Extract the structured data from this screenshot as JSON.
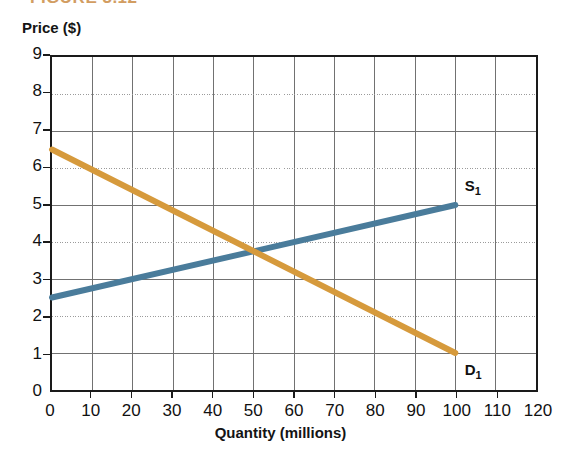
{
  "figure": {
    "caption": "FIGURE 3.12",
    "caption_color": "#C8853A"
  },
  "axes": {
    "y_title": "Price ($)",
    "x_title": "Quantity (millions)",
    "y_ticks": [
      "0",
      "1",
      "2",
      "3",
      "4",
      "5",
      "6",
      "7",
      "8",
      "9"
    ],
    "x_ticks": [
      "0",
      "10",
      "20",
      "30",
      "40",
      "50",
      "60",
      "70",
      "80",
      "90",
      "100",
      "110",
      "120"
    ]
  },
  "series_labels": {
    "supply": "S",
    "supply_sub": "1",
    "demand": "D",
    "demand_sub": "1"
  },
  "colors": {
    "supply": "#4A7C9B",
    "demand": "#D69A3C",
    "frame": "#1a1a1a",
    "grid_solid": "#6f6f6f",
    "grid_dotted": "#9a9a9a"
  },
  "chart_data": {
    "type": "line",
    "title": "FIGURE 3.12",
    "xlabel": "Quantity (millions)",
    "ylabel": "Price ($)",
    "xlim": [
      0,
      120
    ],
    "ylim": [
      0,
      9
    ],
    "xticks": [
      0,
      10,
      20,
      30,
      40,
      50,
      60,
      70,
      80,
      90,
      100,
      110,
      120
    ],
    "yticks": [
      0,
      1,
      2,
      3,
      4,
      5,
      6,
      7,
      8,
      9
    ],
    "grid": true,
    "grid_note": "Vertical gridlines solid at every 10 units; horizontal gridlines solid at odd prices (1,3,5,7) and dotted at even prices (2,4,6,8)",
    "legend": "inline-end-labels",
    "series": [
      {
        "name": "S1",
        "label": "Supply",
        "color": "#4A7C9B",
        "x": [
          0,
          100
        ],
        "y": [
          2.5,
          5.0
        ],
        "points": [
          [
            0,
            2.5
          ],
          [
            10,
            2.75
          ],
          [
            20,
            3.0
          ],
          [
            30,
            3.25
          ],
          [
            40,
            3.5
          ],
          [
            50,
            3.75
          ],
          [
            60,
            4.0
          ],
          [
            70,
            4.25
          ],
          [
            80,
            4.5
          ],
          [
            90,
            4.75
          ],
          [
            100,
            5.0
          ]
        ]
      },
      {
        "name": "D1",
        "label": "Demand",
        "color": "#D69A3C",
        "x": [
          0,
          100
        ],
        "y": [
          6.5,
          1.0
        ],
        "points": [
          [
            0,
            6.5
          ],
          [
            10,
            5.95
          ],
          [
            20,
            5.4
          ],
          [
            30,
            4.85
          ],
          [
            40,
            4.3
          ],
          [
            50,
            3.75
          ],
          [
            60,
            3.2
          ],
          [
            70,
            2.65
          ],
          [
            80,
            2.1
          ],
          [
            90,
            1.55
          ],
          [
            100,
            1.0
          ]
        ]
      }
    ],
    "equilibrium": {
      "quantity": 50,
      "price": 3.75
    }
  }
}
